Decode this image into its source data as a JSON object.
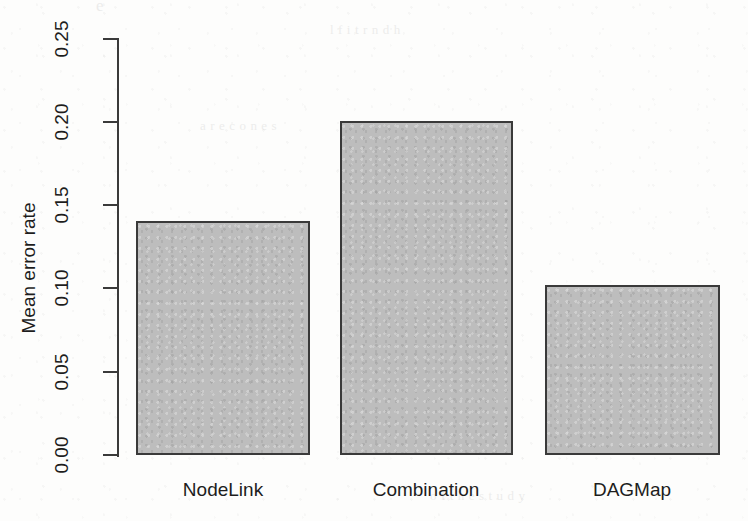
{
  "chart_data": {
    "type": "bar",
    "title": "",
    "xlabel": "",
    "ylabel": "Mean error rate",
    "categories": [
      "NodeLink",
      "Combination",
      "DAGMap"
    ],
    "values": [
      0.14,
      0.2,
      0.102
    ],
    "ylim": [
      0.0,
      0.25
    ],
    "yticks": [
      "0.00",
      "0.05",
      "0.10",
      "0.15",
      "0.20",
      "0.25"
    ],
    "ytick_values": [
      0.0,
      0.05,
      0.1,
      0.15,
      0.2,
      0.25
    ],
    "grid": false,
    "legend": "none",
    "bar_fill_color": "#bdbdbd",
    "bar_border_color": "#3a3a3a",
    "axis_color": "#3a3a3a",
    "text_color": "#1d1d1d"
  },
  "axis": {
    "y_title": "Mean error rate",
    "tick_labels": {
      "t0": "0.00",
      "t1": "0.05",
      "t2": "0.10",
      "t3": "0.15",
      "t4": "0.20",
      "t5": "0.25"
    }
  },
  "bars": [
    {
      "label": "NodeLink",
      "value": 0.14
    },
    {
      "label": "Combination",
      "value": 0.2
    },
    {
      "label": "DAGMap",
      "value": 0.102
    }
  ],
  "ghost_marks": {
    "top_fragment": "e",
    "row_a": "l  f   i   t   r     n   d      h",
    "row_b": "a   r e  c       o   n  e   s",
    "row_c": "t  h  e    m  a  p      w  i  t  h",
    "row_d": "n   i  n     t  h  e       r   e",
    "row_e": "o  f      t  h  e       s  t  u  d  y"
  }
}
